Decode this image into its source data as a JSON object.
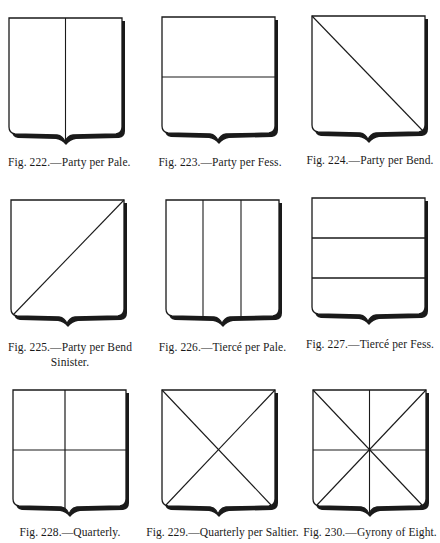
{
  "figures": [
    {
      "number": "222",
      "caption": "Fig. 222.—Party per Pale.",
      "caption_line2": "",
      "division": "per-pale"
    },
    {
      "number": "223",
      "caption": "Fig. 223.—Party per Fess.",
      "caption_line2": "",
      "division": "per-fess"
    },
    {
      "number": "224",
      "caption": "Fig. 224.—Party per Bend.",
      "caption_line2": "",
      "division": "per-bend"
    },
    {
      "number": "225",
      "caption": "Fig. 225.—Party per Bend",
      "caption_line2": "Sinister.",
      "division": "per-bend-sinister"
    },
    {
      "number": "226",
      "caption": "Fig. 226.—Tiercé per Pale.",
      "caption_line2": "",
      "division": "tierce-per-pale"
    },
    {
      "number": "227",
      "caption": "Fig. 227.—Tiercé per Fess.",
      "caption_line2": "",
      "division": "tierce-per-fess"
    },
    {
      "number": "228",
      "caption": "Fig. 228.—Quarterly.",
      "caption_line2": "",
      "division": "quarterly"
    },
    {
      "number": "229",
      "caption": "Fig. 229.—Quarterly per Saltier.",
      "caption_line2": "",
      "division": "quarterly-per-saltire"
    },
    {
      "number": "230",
      "caption": "Fig. 230.—Gyrony of Eight.",
      "caption_line2": "",
      "division": "gyrony-of-eight"
    }
  ],
  "colors": {
    "ink": "#1a1a1a",
    "paper": "#ffffff"
  }
}
